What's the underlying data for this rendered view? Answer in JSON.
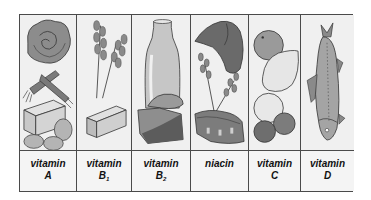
{
  "figure": {
    "columns": [
      {
        "id": "vitamin-a",
        "line1": "vitamin",
        "line2": "A",
        "subscript": "",
        "foods": [
          "cabbage",
          "carrots",
          "butter",
          "eggs"
        ]
      },
      {
        "id": "vitamin-b1",
        "line1": "vitamin",
        "line2": "B",
        "subscript": "1",
        "foods": [
          "wheat",
          "butter"
        ]
      },
      {
        "id": "vitamin-b2",
        "line1": "vitamin",
        "line2": "B",
        "subscript": "2",
        "foods": [
          "milk bottle",
          "liver",
          "meat"
        ]
      },
      {
        "id": "niacin",
        "line1": "niacin",
        "line2": "",
        "subscript": "",
        "foods": [
          "liver",
          "wheat",
          "meat"
        ]
      },
      {
        "id": "vitamin-c",
        "line1": "vitamin",
        "line2": "C",
        "subscript": "",
        "foods": [
          "orange",
          "lemon",
          "grapefruit",
          "tomatoes"
        ]
      },
      {
        "id": "vitamin-d",
        "line1": "vitamin",
        "line2": "D",
        "subscript": "",
        "foods": [
          "fish"
        ]
      }
    ]
  },
  "colors": {
    "border": "#4a4a4a",
    "background": "#f2f2f2",
    "dark_fill": "#6e6e6e",
    "mid_fill": "#a8a8a8",
    "light_fill": "#dcdcdc",
    "text": "#111111"
  }
}
